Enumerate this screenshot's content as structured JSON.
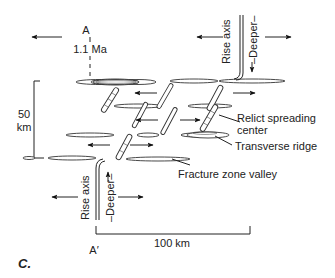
{
  "figure": {
    "panel_letter": "C.",
    "profile_start": "A",
    "profile_end": "A′",
    "age_label": "1.1 Ma",
    "scale_vertical": {
      "value": "50",
      "unit": "km"
    },
    "scale_horizontal": "100 km"
  },
  "labels": {
    "rise_axis_top": "Rise axis",
    "deeper_top": "–Deeper–",
    "rise_axis_bottom": "Rise axis",
    "deeper_bottom": "–Deeper–",
    "relict_line1": "Relict spreading",
    "relict_line2": "center",
    "transverse_ridge": "Transverse ridge",
    "fracture_zone_valley": "Fracture zone valley"
  },
  "icons": {
    "arrow": "arrow-icon",
    "ridge_segment": "ridge-segment-icon",
    "fracture_valley": "fracture-valley-icon"
  }
}
